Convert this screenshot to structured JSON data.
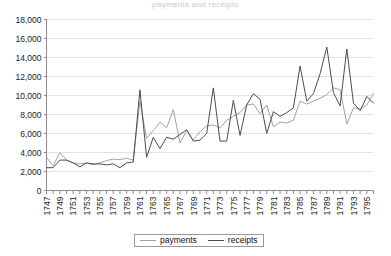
{
  "chart_data": {
    "type": "line",
    "title": "payments and receipts",
    "xlabel": "",
    "ylabel": "",
    "ylim": [
      0,
      18000
    ],
    "ytick_step": 2000,
    "ytick_labels": [
      "0",
      "2,000",
      "4,000",
      "6,000",
      "8,000",
      "10,000",
      "12,000",
      "14,000",
      "16,000",
      "18,000"
    ],
    "grid": true,
    "legend_position": "bottom",
    "x": [
      1747,
      1748,
      1749,
      1750,
      1751,
      1752,
      1753,
      1754,
      1755,
      1756,
      1757,
      1758,
      1759,
      1760,
      1761,
      1762,
      1763,
      1764,
      1765,
      1766,
      1767,
      1768,
      1769,
      1770,
      1771,
      1772,
      1773,
      1774,
      1775,
      1776,
      1777,
      1778,
      1779,
      1780,
      1781,
      1782,
      1783,
      1784,
      1785,
      1786,
      1787,
      1788,
      1789,
      1790,
      1791,
      1792,
      1793,
      1794,
      1795,
      1796
    ],
    "xtick_labels": [
      "1747",
      "1749",
      "1751",
      "1753",
      "1755",
      "1757",
      "1759",
      "1761",
      "1763",
      "1765",
      "1767",
      "1769",
      "1771",
      "1773",
      "1775",
      "1777",
      "1779",
      "1781",
      "1783",
      "1785",
      "1787",
      "1789",
      "1791",
      "1793",
      "1795"
    ],
    "series": [
      {
        "name": "payments",
        "color": "#a3a3a3",
        "values": [
          3500,
          2600,
          4000,
          3200,
          2900,
          2800,
          2900,
          2700,
          2900,
          3150,
          3300,
          3250,
          3400,
          3200,
          9400,
          5500,
          6300,
          7200,
          6600,
          8500,
          5000,
          6300,
          5300,
          6200,
          6800,
          6900,
          6600,
          7400,
          7800,
          8200,
          9000,
          9100,
          8100,
          9000,
          6700,
          7200,
          7100,
          7400,
          9400,
          9100,
          9400,
          9700,
          10100,
          10800,
          10600,
          7000,
          8700,
          8600,
          9000,
          10200
        ],
        "labeled_extrema": [
          {
            "x": 1761,
            "y": 9400
          },
          {
            "x": 1766,
            "y": 8500
          },
          {
            "x": 1790,
            "y": 10800
          },
          {
            "x": 1792,
            "y": 7000
          }
        ]
      },
      {
        "name": "receipts",
        "color": "#4d4d4d",
        "values": [
          2400,
          2400,
          3200,
          3200,
          2900,
          2500,
          2900,
          2800,
          2800,
          2700,
          2800,
          2400,
          2900,
          3000,
          10600,
          3500,
          5600,
          4400,
          5600,
          5400,
          5900,
          6400,
          5200,
          5300,
          6000,
          10800,
          5200,
          5200,
          9500,
          5800,
          9000,
          10200,
          9600,
          6000,
          8300,
          7800,
          8200,
          8700,
          13100,
          9400,
          10200,
          12300,
          15100,
          10300,
          8900,
          14900,
          9200,
          8400,
          9900,
          9200
        ],
        "labeled_extrema": [
          {
            "x": 1761,
            "y": 10600
          },
          {
            "x": 1772,
            "y": 10800
          },
          {
            "x": 1785,
            "y": 13100
          },
          {
            "x": 1789,
            "y": 15100
          },
          {
            "x": 1792,
            "y": 14900
          }
        ]
      }
    ]
  },
  "legend": {
    "items": [
      {
        "label": "payments",
        "color": "#a3a3a3"
      },
      {
        "label": "receipts",
        "color": "#4d4d4d"
      }
    ]
  }
}
